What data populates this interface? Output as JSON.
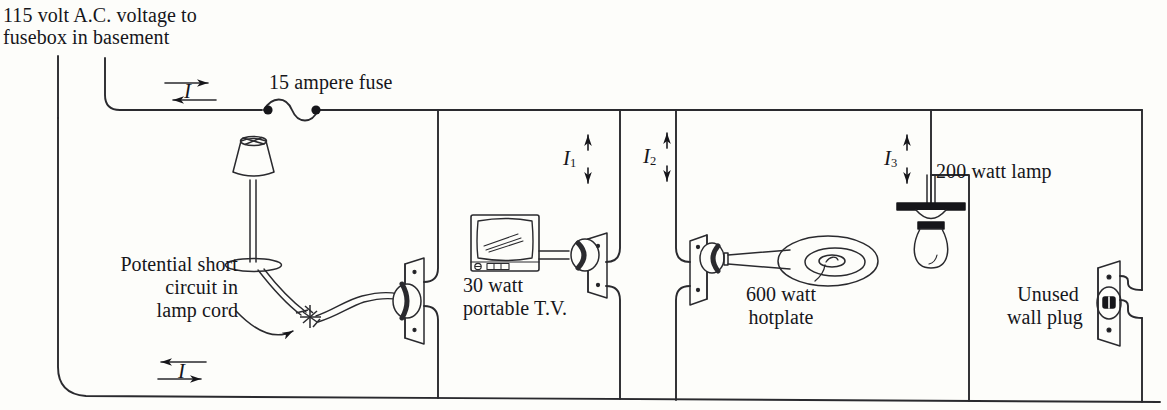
{
  "figure": {
    "background_color": "#fdfdfa",
    "ink_color": "#16161a"
  },
  "labels": {
    "supply_line1": "115 volt A.C. voltage to",
    "supply_line2": "fusebox in basement",
    "fuse": "15 ampere fuse",
    "short_circuit_line1": "Potential short",
    "short_circuit_line2": "circuit in",
    "short_circuit_line3": "lamp cord",
    "tv_line1": "30 watt",
    "tv_line2": "portable T.V.",
    "hotplate_line1": "600 watt",
    "hotplate_line2": "hotplate",
    "ceiling_lamp": "200 watt lamp",
    "wall_plug_line1": "Unused",
    "wall_plug_line2": "wall plug"
  },
  "currents": [
    {
      "name": "current-main-top",
      "symbol": "I",
      "subscript": "",
      "direction": "horizontal-bidirectional"
    },
    {
      "name": "current-main-bottom",
      "symbol": "I",
      "subscript": "",
      "direction": "horizontal-bidirectional"
    },
    {
      "name": "current-branch-1",
      "symbol": "I",
      "subscript": "1",
      "direction": "vertical-bidirectional"
    },
    {
      "name": "current-branch-2",
      "symbol": "I",
      "subscript": "2",
      "direction": "vertical-bidirectional"
    },
    {
      "name": "current-branch-3",
      "symbol": "I",
      "subscript": "3",
      "direction": "vertical-bidirectional"
    }
  ],
  "devices": [
    {
      "name": "table-lamp",
      "rating": "",
      "description": "table lamp with shade and frayed cord"
    },
    {
      "name": "portable-tv",
      "rating": "30 watt",
      "description": "30 watt portable T.V."
    },
    {
      "name": "hotplate",
      "rating": "600 watt",
      "description": "600 watt hotplate"
    },
    {
      "name": "ceiling-lamp",
      "rating": "200 watt",
      "description": "200 watt lamp"
    },
    {
      "name": "wall-plug",
      "rating": "",
      "description": "Unused wall plug"
    },
    {
      "name": "fuse",
      "rating": "15 ampere",
      "description": "15 ampere fuse"
    }
  ]
}
